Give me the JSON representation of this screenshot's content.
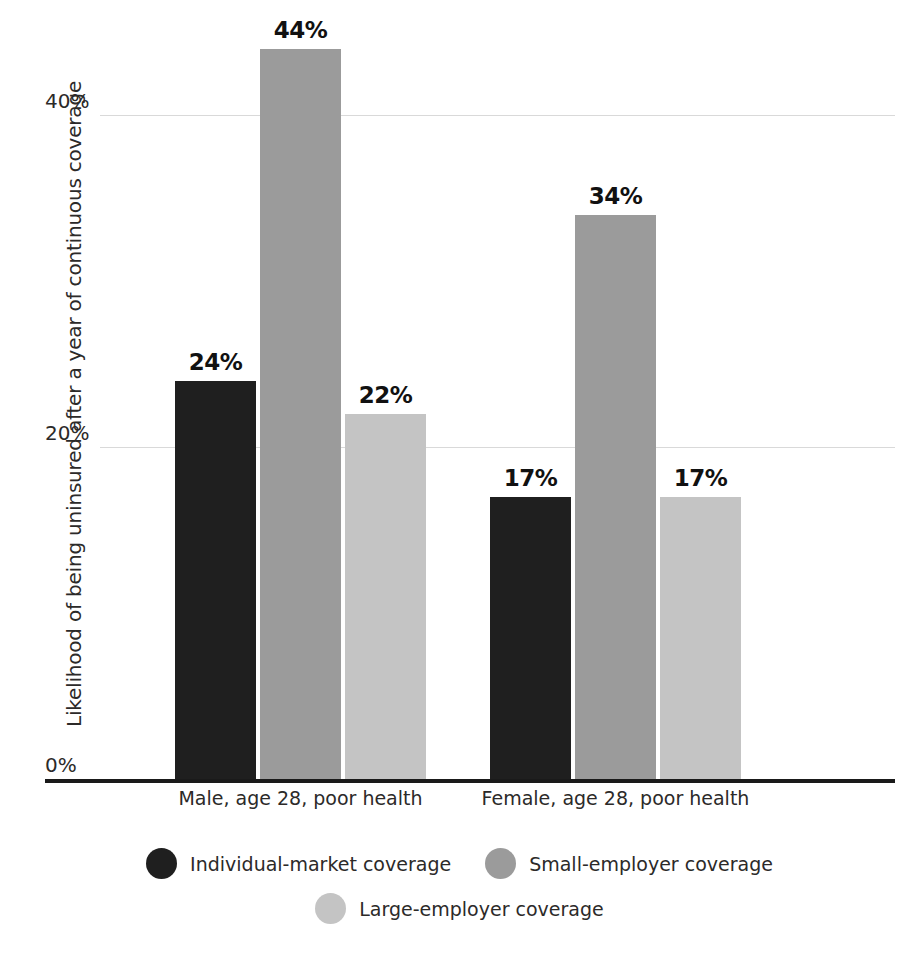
{
  "chart_data": {
    "type": "bar",
    "title": "",
    "xlabel": "",
    "ylabel": "Likelihood of being uninsured after a year of continuous coverage",
    "categories": [
      "Male, age 28, poor health",
      "Female, age 28, poor health"
    ],
    "series": [
      {
        "name": "Individual-market coverage",
        "color": "#1f1f1f",
        "values": [
          24,
          17
        ],
        "labels": [
          "24%",
          "17%"
        ]
      },
      {
        "name": "Small-employer coverage",
        "color": "#9b9b9b",
        "values": [
          44,
          34
        ],
        "labels": [
          "44%",
          "34%"
        ]
      },
      {
        "name": "Large-employer coverage",
        "color": "#c4c4c4",
        "values": [
          22,
          17
        ],
        "labels": [
          "22%",
          "17%"
        ]
      }
    ],
    "ylim": [
      0,
      47
    ],
    "yticks": [
      0,
      20,
      40
    ],
    "ytick_labels": [
      "0%",
      "20%",
      "40%"
    ],
    "grid": true,
    "legend_position": "bottom",
    "value_labels_shown": true,
    "axis_line_color": "#1a1a1a",
    "gridline_color": "#d9d9d9"
  },
  "axis": {
    "y_title": "Likelihood of being uninsured after a year of continuous coverage",
    "ticks": [
      {
        "label": "40%",
        "value": 40
      },
      {
        "label": "20%",
        "value": 20
      },
      {
        "label": "0%",
        "value": 0
      }
    ]
  },
  "groups": [
    {
      "label": "Male, age 28, poor health",
      "bars": [
        {
          "series": "Individual-market coverage",
          "label": "24%",
          "value": 24,
          "color": "#1f1f1f"
        },
        {
          "series": "Small-employer coverage",
          "label": "44%",
          "value": 44,
          "color": "#9b9b9b"
        },
        {
          "series": "Large-employer coverage",
          "label": "22%",
          "value": 22,
          "color": "#c4c4c4"
        }
      ]
    },
    {
      "label": "Female, age 28, poor health",
      "bars": [
        {
          "series": "Individual-market coverage",
          "label": "17%",
          "value": 17,
          "color": "#1f1f1f"
        },
        {
          "series": "Small-employer coverage",
          "label": "34%",
          "value": 34,
          "color": "#9b9b9b"
        },
        {
          "series": "Large-employer coverage",
          "label": "17%",
          "value": 17,
          "color": "#c4c4c4"
        }
      ]
    }
  ],
  "legend": {
    "rows": [
      [
        {
          "label": "Individual-market coverage",
          "color": "#1f1f1f"
        },
        {
          "label": "Small-employer coverage",
          "color": "#9b9b9b"
        }
      ],
      [
        {
          "label": "Large-employer coverage",
          "color": "#c4c4c4"
        }
      ]
    ]
  }
}
